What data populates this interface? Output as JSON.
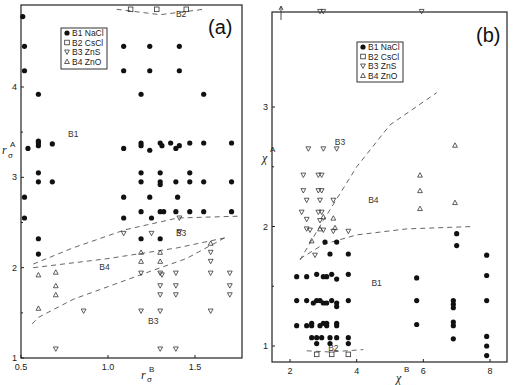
{
  "chart_data": [
    {
      "panel_label": "(a)",
      "type": "scatter",
      "xlabel": "r_σ^B",
      "ylabel": "r_σ^A",
      "xlim": [
        0.5,
        1.77
      ],
      "ylim": [
        1.0,
        4.9
      ],
      "xticks": [
        0.5,
        1.0,
        1.5
      ],
      "xtick_labels": [
        "0.5",
        "1.0",
        "1.5"
      ],
      "yticks": [
        1,
        2,
        3,
        4
      ],
      "ytick_labels": [
        "1",
        "2",
        "3",
        "4"
      ],
      "grid": false,
      "legend_position": "upper-left inset",
      "legend": [
        "B1 NaCl",
        "B2 CsCl",
        "B3 ZnS",
        "B4 ZnO"
      ],
      "region_labels": [
        {
          "text": "B2",
          "x": 1.42,
          "y": 4.78
        },
        {
          "text": "B1",
          "x": 0.8,
          "y": 3.45
        },
        {
          "text": "B3",
          "x": 1.42,
          "y": 2.35
        },
        {
          "text": "B4",
          "x": 0.98,
          "y": 1.97
        },
        {
          "text": "B3",
          "x": 1.26,
          "y": 1.38
        }
      ],
      "series": [
        {
          "name": "B1 NaCl",
          "marker": "filled-circle",
          "points": [
            [
              0.51,
              4.78
            ],
            [
              0.52,
              4.45
            ],
            [
              0.52,
              4.18
            ],
            [
              0.6,
              3.92
            ],
            [
              0.54,
              3.32
            ],
            [
              0.6,
              3.35
            ],
            [
              0.6,
              3.38
            ],
            [
              0.6,
              3.4
            ],
            [
              0.68,
              3.37
            ],
            [
              0.6,
              3.05
            ],
            [
              0.6,
              2.95
            ],
            [
              0.68,
              2.95
            ],
            [
              0.52,
              2.78
            ],
            [
              0.52,
              2.55
            ],
            [
              0.6,
              2.32
            ],
            [
              0.6,
              2.15
            ],
            [
              1.09,
              4.45
            ],
            [
              1.09,
              4.18
            ],
            [
              1.19,
              3.92
            ],
            [
              1.09,
              3.32
            ],
            [
              1.19,
              3.38
            ],
            [
              1.19,
              3.35
            ],
            [
              1.24,
              3.3
            ],
            [
              1.3,
              3.38
            ],
            [
              1.31,
              3.35
            ],
            [
              1.36,
              3.38
            ],
            [
              1.39,
              3.32
            ],
            [
              1.41,
              3.35
            ],
            [
              1.19,
              3.05
            ],
            [
              1.19,
              2.95
            ],
            [
              1.3,
              3.05
            ],
            [
              1.3,
              2.95
            ],
            [
              1.3,
              2.92
            ],
            [
              1.39,
              2.95
            ],
            [
              1.47,
              3.05
            ],
            [
              1.47,
              2.95
            ],
            [
              1.55,
              2.95
            ],
            [
              1.09,
              2.78
            ],
            [
              1.24,
              2.78
            ],
            [
              1.4,
              2.78
            ],
            [
              1.09,
              2.55
            ],
            [
              1.19,
              2.62
            ],
            [
              1.25,
              2.55
            ],
            [
              1.3,
              2.62
            ],
            [
              1.32,
              2.62
            ],
            [
              1.39,
              2.62
            ],
            [
              1.55,
              2.62
            ],
            [
              1.19,
              2.32
            ],
            [
              1.3,
              2.32
            ],
            [
              1.24,
              4.45
            ],
            [
              1.24,
              4.18
            ],
            [
              1.41,
              4.45
            ],
            [
              1.41,
              4.18
            ],
            [
              1.55,
              3.92
            ],
            [
              1.55,
              3.38
            ],
            [
              1.47,
              3.38
            ],
            [
              1.71,
              3.38
            ],
            [
              1.71,
              2.95
            ],
            [
              1.71,
              2.62
            ],
            [
              1.47,
              2.62
            ]
          ]
        },
        {
          "name": "B2 CsCl",
          "marker": "open-square",
          "points": [
            [
              1.13,
              4.86
            ],
            [
              1.28,
              4.86
            ],
            [
              1.45,
              4.86
            ]
          ]
        },
        {
          "name": "B3 ZnS",
          "marker": "open-triangle-down",
          "points": [
            [
              0.7,
              1.1
            ],
            [
              1.3,
              1.1
            ],
            [
              1.39,
              1.1
            ],
            [
              1.09,
              2.38
            ],
            [
              1.25,
              2.38
            ],
            [
              1.41,
              2.4
            ],
            [
              1.41,
              2.55
            ],
            [
              0.86,
              1.52
            ],
            [
              1.19,
              1.52
            ],
            [
              1.3,
              1.52
            ],
            [
              1.59,
              1.52
            ],
            [
              1.19,
              1.94
            ],
            [
              1.3,
              1.94
            ],
            [
              1.31,
              1.92
            ],
            [
              1.39,
              1.94
            ],
            [
              1.59,
              1.94
            ],
            [
              1.7,
              1.94
            ],
            [
              1.3,
              1.8
            ],
            [
              1.39,
              1.8
            ],
            [
              1.7,
              1.8
            ],
            [
              1.3,
              1.7
            ],
            [
              1.39,
              1.7
            ],
            [
              1.7,
              1.7
            ],
            [
              1.59,
              2.07
            ],
            [
              1.59,
              2.17
            ]
          ]
        },
        {
          "name": "B4 ZnO",
          "marker": "open-triangle-up",
          "points": [
            [
              0.6,
              1.92
            ],
            [
              0.7,
              1.95
            ],
            [
              0.7,
              1.8
            ],
            [
              0.7,
              1.7
            ],
            [
              0.6,
              1.55
            ],
            [
              1.19,
              2.17
            ],
            [
              1.19,
              2.07
            ],
            [
              1.3,
              2.17
            ],
            [
              1.3,
              2.07
            ],
            [
              1.59,
              2.27
            ]
          ]
        }
      ],
      "boundaries": [
        {
          "between": "B2/B1",
          "points": [
            [
              1.05,
              4.86
            ],
            [
              1.3,
              4.8
            ],
            [
              1.55,
              4.86
            ]
          ]
        },
        {
          "between": "B1/B3",
          "points": [
            [
              0.57,
              2.04
            ],
            [
              0.8,
              2.22
            ],
            [
              1.1,
              2.42
            ],
            [
              1.4,
              2.55
            ],
            [
              1.75,
              2.57
            ]
          ]
        },
        {
          "between": "B3/B4",
          "points": [
            [
              0.57,
              2.0
            ],
            [
              1.0,
              2.1
            ],
            [
              1.4,
              2.22
            ],
            [
              1.67,
              2.33
            ]
          ]
        },
        {
          "between": "B4/B3",
          "points": [
            [
              1.67,
              2.33
            ],
            [
              1.45,
              2.1
            ],
            [
              1.2,
              1.93
            ],
            [
              0.8,
              1.65
            ],
            [
              0.6,
              1.45
            ],
            [
              0.55,
              1.35
            ]
          ]
        }
      ]
    },
    {
      "panel_label": "(b)",
      "type": "scatter",
      "xlabel": "χ^B",
      "ylabel": "χ^A",
      "xlim": [
        1.8,
        8.3
      ],
      "ylim": [
        0.88,
        3.9
      ],
      "xticks": [
        2,
        4,
        6,
        8
      ],
      "xtick_labels": [
        "2",
        "4",
        "6",
        "8"
      ],
      "yticks": [
        1,
        2,
        3
      ],
      "ytick_labels": [
        "1",
        "2",
        "3"
      ],
      "grid": false,
      "legend_position": "upper-center inset",
      "legend": [
        "B1 NaCl",
        "B2 CsCl",
        "B3 ZnS",
        "B4 ZnO"
      ],
      "region_labels": [
        {
          "text": "B3",
          "x": 3.5,
          "y": 2.68
        },
        {
          "text": "B4",
          "x": 4.5,
          "y": 2.2
        },
        {
          "text": "B1",
          "x": 4.6,
          "y": 1.5
        },
        {
          "text": "B2",
          "x": 3.3,
          "y": 0.96
        }
      ],
      "series": [
        {
          "name": "B1 NaCl",
          "marker": "filled-circle",
          "points": [
            [
              2.2,
              1.58
            ],
            [
              2.5,
              1.58
            ],
            [
              2.8,
              1.6
            ],
            [
              3.0,
              1.58
            ],
            [
              3.1,
              1.58
            ],
            [
              3.25,
              1.6
            ],
            [
              3.4,
              1.56
            ],
            [
              3.75,
              1.6
            ],
            [
              2.2,
              1.38
            ],
            [
              2.5,
              1.38
            ],
            [
              2.7,
              1.36
            ],
            [
              2.8,
              1.38
            ],
            [
              2.9,
              1.38
            ],
            [
              3.0,
              1.36
            ],
            [
              3.1,
              1.36
            ],
            [
              3.25,
              1.38
            ],
            [
              3.4,
              1.36
            ],
            [
              3.4,
              1.33
            ],
            [
              3.75,
              1.38
            ],
            [
              2.2,
              1.17
            ],
            [
              2.5,
              1.17
            ],
            [
              2.65,
              1.19
            ],
            [
              2.65,
              1.17
            ],
            [
              2.9,
              1.17
            ],
            [
              3.0,
              1.19
            ],
            [
              3.1,
              1.19
            ],
            [
              3.1,
              1.17
            ],
            [
              3.4,
              1.19
            ],
            [
              3.4,
              1.17
            ],
            [
              2.65,
              1.07
            ],
            [
              2.8,
              1.07
            ],
            [
              2.95,
              1.07
            ],
            [
              3.2,
              1.07
            ],
            [
              3.4,
              1.07
            ],
            [
              3.75,
              1.07
            ],
            [
              2.8,
              1.02
            ],
            [
              3.2,
              1.02
            ],
            [
              3.75,
              1.02
            ],
            [
              3.2,
              1.77
            ],
            [
              3.75,
              1.77
            ],
            [
              3.05,
              1.87
            ],
            [
              3.4,
              1.87
            ],
            [
              5.8,
              1.57
            ],
            [
              5.8,
              1.38
            ],
            [
              5.8,
              1.18
            ],
            [
              7.0,
              1.94
            ],
            [
              7.0,
              1.84
            ],
            [
              6.9,
              1.38
            ],
            [
              6.9,
              1.35
            ],
            [
              6.9,
              1.32
            ],
            [
              6.9,
              1.2
            ],
            [
              6.9,
              1.17
            ],
            [
              6.9,
              1.06
            ],
            [
              7.9,
              1.76
            ],
            [
              7.9,
              1.59
            ],
            [
              7.9,
              1.38
            ],
            [
              7.9,
              1.08
            ],
            [
              7.9,
              1.0
            ],
            [
              7.9,
              0.92
            ]
          ]
        },
        {
          "name": "B2 CsCl",
          "marker": "open-square",
          "points": [
            [
              2.8,
              0.93
            ],
            [
              3.25,
              0.93
            ],
            [
              3.75,
              0.93
            ]
          ]
        },
        {
          "name": "B3 ZnS",
          "marker": "open-triangle-down",
          "points": [
            [
              2.55,
              3.82
            ],
            [
              2.9,
              3.8
            ],
            [
              3.0,
              3.8
            ],
            [
              5.95,
              3.8
            ],
            [
              2.55,
              2.65
            ],
            [
              3.0,
              2.65
            ],
            [
              3.4,
              2.65
            ],
            [
              2.4,
              2.43
            ],
            [
              2.85,
              2.43
            ],
            [
              2.95,
              2.43
            ],
            [
              2.4,
              2.3
            ],
            [
              2.85,
              2.3
            ],
            [
              2.95,
              2.3
            ],
            [
              2.5,
              2.22
            ],
            [
              2.9,
              2.22
            ],
            [
              3.3,
              2.22
            ],
            [
              2.35,
              2.12
            ],
            [
              2.85,
              2.12
            ],
            [
              2.95,
              2.12
            ],
            [
              2.5,
              2.06
            ],
            [
              2.9,
              2.05
            ],
            [
              2.5,
              1.98
            ],
            [
              2.6,
              1.97
            ],
            [
              3.0,
              1.97
            ],
            [
              3.3,
              1.96
            ],
            [
              3.75,
              1.96
            ],
            [
              2.75,
              1.76
            ]
          ]
        },
        {
          "name": "B4 ZnO",
          "marker": "open-triangle-up",
          "points": [
            [
              5.9,
              2.43
            ],
            [
              5.9,
              2.3
            ],
            [
              5.9,
              2.15
            ],
            [
              6.95,
              2.68
            ],
            [
              6.95,
              2.2
            ],
            [
              3.0,
              2.08
            ],
            [
              3.3,
              2.07
            ],
            [
              2.9,
              1.98
            ],
            [
              3.35,
              1.99
            ],
            [
              2.65,
              1.88
            ]
          ]
        }
      ],
      "boundaries": [
        {
          "between": "B3/B4",
          "points": [
            [
              2.3,
              1.72
            ],
            [
              3.0,
              2.05
            ],
            [
              4.0,
              2.5
            ],
            [
              5.0,
              2.85
            ],
            [
              6.4,
              3.12
            ]
          ]
        },
        {
          "between": "B4/B1",
          "points": [
            [
              2.3,
              1.73
            ],
            [
              3.0,
              1.85
            ],
            [
              4.0,
              1.93
            ],
            [
              5.5,
              1.98
            ],
            [
              7.5,
              2.0
            ]
          ]
        },
        {
          "between": "B1/B2",
          "points": [
            [
              2.5,
              0.96
            ],
            [
              3.2,
              0.95
            ],
            [
              4.2,
              0.97
            ]
          ]
        }
      ]
    }
  ]
}
